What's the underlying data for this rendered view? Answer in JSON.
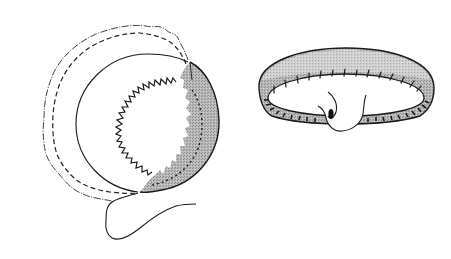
{
  "figure": {
    "background": "#ffffff",
    "ink_color": "#1a1a1a",
    "shade_color": "#9a9a9a",
    "shade_light": "#c4c4c4",
    "panels": [
      {
        "id": "left",
        "description": "Circular fabric piece with pinked (zigzag) center opening, dashed stitching line, partially folded shaded edge, and trailing thread",
        "elements": [
          "outer-wavy-edge",
          "dashed-stitch-line",
          "inner-circle",
          "zigzag-opening",
          "shaded-fold-crescent",
          "trailing-thread"
        ]
      },
      {
        "id": "right",
        "description": "Finished shaded ring/band with stitch marks and a loop tab at the bottom",
        "elements": [
          "ring-outer-ellipse",
          "ring-inner-ellipse",
          "stitch-ticks",
          "loop-tab"
        ]
      }
    ]
  }
}
